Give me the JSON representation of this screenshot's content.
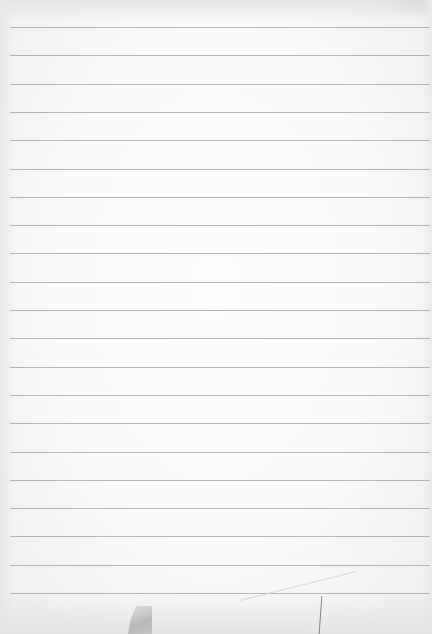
{
  "image": {
    "subject": "Blank ruled notebook paper",
    "ruled_line_count": 21,
    "paper_color": "#f9f9f9",
    "rule_color": "#a9a9a9",
    "text_content": ""
  }
}
